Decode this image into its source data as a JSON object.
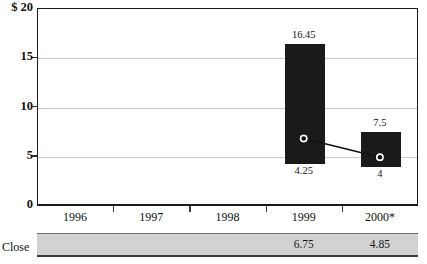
{
  "chart_data": {
    "type": "bar",
    "title": "",
    "xlabel": "",
    "ylabel": "$",
    "ylim": [
      0,
      20
    ],
    "grid": true,
    "legend_position": "none",
    "categories": [
      "1996",
      "1997",
      "1998",
      "1999",
      "2000*"
    ],
    "y_ticks": [
      "$ 20",
      "15",
      "10",
      "5",
      "0"
    ],
    "y_tick_values": [
      20,
      15,
      10,
      5,
      0
    ],
    "series": [
      {
        "name": "High",
        "type": "bar_top_label",
        "values": [
          null,
          null,
          null,
          16.45,
          7.5
        ],
        "labels": [
          "",
          "",
          "",
          "16.45",
          "7.5"
        ]
      },
      {
        "name": "Low",
        "type": "bar_bottom_label",
        "values": [
          null,
          null,
          null,
          4.25,
          4
        ],
        "labels": [
          "",
          "",
          "",
          "4.25",
          "4"
        ]
      },
      {
        "name": "Close",
        "type": "line",
        "values": [
          null,
          null,
          null,
          6.75,
          4.85
        ],
        "labels": [
          "",
          "",
          "",
          "6.75",
          "4.85"
        ]
      }
    ],
    "bars": [
      {
        "category": "1999",
        "top": 16.45,
        "bottom": 4.25,
        "top_label": "16.45",
        "bottom_label": "4.25"
      },
      {
        "category": "2000*",
        "top": 7.5,
        "bottom": 4,
        "top_label": "7.5",
        "bottom_label": "4"
      }
    ],
    "close_points": [
      {
        "category": "1999",
        "value": 6.75,
        "label": "6.75"
      },
      {
        "category": "2000*",
        "value": 4.85,
        "label": "4.85"
      }
    ],
    "colors": {
      "bar": "#1a1a1a",
      "grid": "#c9c9c9",
      "axis": "#1b1b1b",
      "close_band": "#d2d2d2",
      "marker_fill": "#111111",
      "marker_ring": "#ffffff"
    }
  },
  "chart": {
    "title_sliver": "",
    "close_row": {
      "label": "Close",
      "values": [
        "",
        "",
        "",
        "6.75",
        "4.85"
      ]
    }
  }
}
